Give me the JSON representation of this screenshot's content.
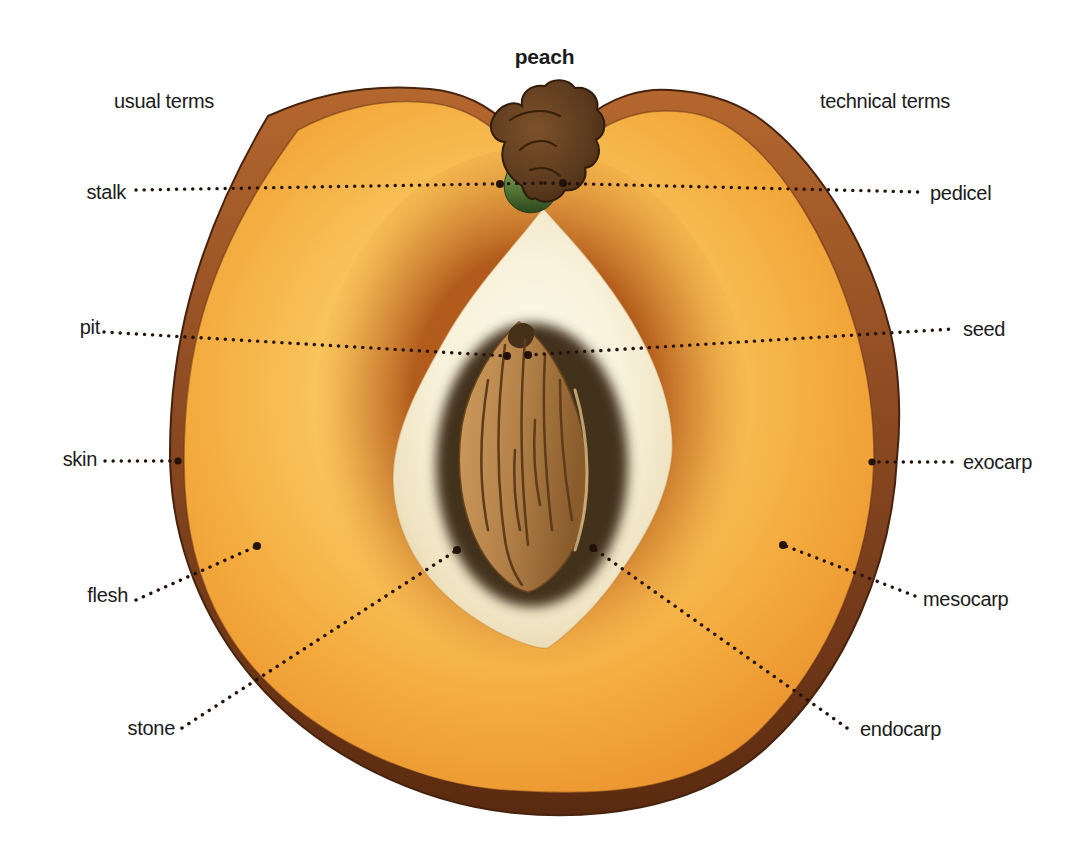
{
  "title": "peach",
  "columns": {
    "left": "usual terms",
    "right": "technical terms"
  },
  "pairs": [
    {
      "usual": "stalk",
      "technical": "pedicel"
    },
    {
      "usual": "pit",
      "technical": "seed"
    },
    {
      "usual": "skin",
      "technical": "exocarp"
    },
    {
      "usual": "flesh",
      "technical": "mesocarp"
    },
    {
      "usual": "stone",
      "technical": "endocarp"
    }
  ],
  "colors": {
    "background": "#ffffff",
    "text": "#1b1b1b",
    "leader_dot": "#231209",
    "skin_light": "#b4672e",
    "skin_dark": "#5a2a10",
    "flesh_inner": "#fdda80",
    "flesh_outer": "#e98f2c",
    "cavity_cream": "#f8f1da",
    "stone_brown": "#b5834a",
    "stem_brown": "#5d3b1f",
    "stem_green": "#567a3a"
  }
}
